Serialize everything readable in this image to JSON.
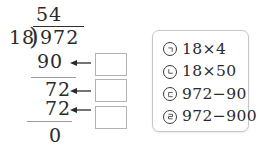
{
  "division": {
    "quotient": "54",
    "divisor": "18",
    "bracket": ")",
    "dividend": "972",
    "steps": [
      {
        "value": "90"
      },
      {
        "value": "72"
      },
      {
        "value": "72"
      }
    ],
    "remainder": "0"
  },
  "panel": {
    "options": [
      {
        "marker": "㉠",
        "expr": "18×4"
      },
      {
        "marker": "㉡",
        "expr": "18×50"
      },
      {
        "marker": "㉢",
        "expr": "972−90"
      },
      {
        "marker": "㉣",
        "expr": "972−900"
      }
    ]
  },
  "colors": {
    "ink": "#2a2a2a",
    "rule_line": "#9c9c9c",
    "answer_box_border": "#b3b3b3",
    "panel_border": "#c6c6c6",
    "background": "#ffffff"
  }
}
